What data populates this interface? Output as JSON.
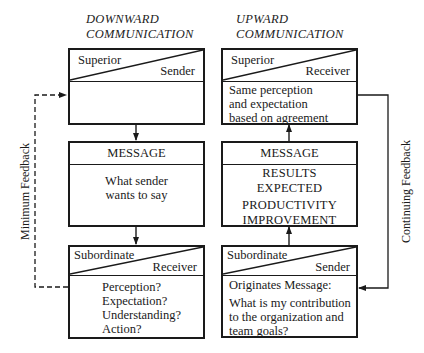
{
  "columns": {
    "downward": {
      "title_line1": "DOWNWARD",
      "title_line2": "COMMUNICATION",
      "top_box": {
        "role_top": "Superior",
        "role_bottom": "Sender",
        "body": ""
      },
      "message_box": {
        "header": "MESSAGE",
        "body_lines": [
          "What sender",
          "wants to say"
        ]
      },
      "bottom_box": {
        "role_top": "Subordinate",
        "role_bottom": "Receiver",
        "body_lines": [
          "Perception?",
          "Expectation?",
          "Understanding?",
          "Action?"
        ]
      }
    },
    "upward": {
      "title_line1": "UPWARD",
      "title_line2": "COMMUNICATION",
      "top_box": {
        "role_top": "Superior",
        "role_bottom": "Receiver",
        "body_lines": [
          "Same perception",
          "and expectation",
          "based on agreement"
        ]
      },
      "message_box": {
        "header": "MESSAGE",
        "body_lines": [
          "RESULTS",
          "EXPECTED",
          "PRODUCTIVITY",
          "IMPROVEMENT"
        ]
      },
      "bottom_box": {
        "role_top": "Subordinate",
        "role_bottom": "Sender",
        "body_lines": [
          "Originates Message:",
          "What is my contribution",
          "to the organization and",
          "team goals?"
        ]
      }
    }
  },
  "feedback": {
    "left_label": "Minimum Feedback",
    "right_label": "Continuing Feedback"
  }
}
